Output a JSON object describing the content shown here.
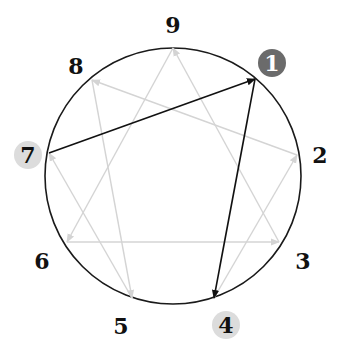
{
  "diagram": {
    "type": "enneagram",
    "circle": {
      "cx": 173,
      "cy": 176,
      "r": 128,
      "stroke": "#1a1a1a"
    },
    "colors": {
      "active_line": "#111111",
      "inactive_line": "#d4d4d4",
      "highlight_dark": "#6b6b6b",
      "highlight_light": "#dcdcdc"
    },
    "points": [
      {
        "id": "1",
        "label": "1",
        "x": 255,
        "y": 79,
        "lx": 272,
        "ly": 63,
        "badge": "dark"
      },
      {
        "id": "2",
        "label": "2",
        "x": 297,
        "y": 155,
        "lx": 320,
        "ly": 155,
        "badge": "none"
      },
      {
        "id": "3",
        "label": "3",
        "x": 279,
        "y": 242,
        "lx": 303,
        "ly": 261,
        "badge": "none"
      },
      {
        "id": "4",
        "label": "4",
        "x": 214,
        "y": 298,
        "lx": 226,
        "ly": 325,
        "badge": "light"
      },
      {
        "id": "5",
        "label": "5",
        "x": 132,
        "y": 298,
        "lx": 121,
        "ly": 326,
        "badge": "none"
      },
      {
        "id": "6",
        "label": "6",
        "x": 67,
        "y": 242,
        "lx": 42,
        "ly": 261,
        "badge": "none"
      },
      {
        "id": "7",
        "label": "7",
        "x": 49,
        "y": 153,
        "lx": 28,
        "ly": 155,
        "badge": "light"
      },
      {
        "id": "8",
        "label": "8",
        "x": 92,
        "y": 80,
        "lx": 76,
        "ly": 66,
        "badge": "none"
      },
      {
        "id": "9",
        "label": "9",
        "x": 173,
        "y": 48,
        "lx": 173,
        "ly": 25,
        "badge": "none"
      }
    ],
    "arrows": [
      {
        "from": "7",
        "to": "1",
        "style": "active"
      },
      {
        "from": "1",
        "to": "4",
        "style": "active"
      },
      {
        "from": "4",
        "to": "2",
        "style": "inactive"
      },
      {
        "from": "2",
        "to": "8",
        "style": "inactive"
      },
      {
        "from": "8",
        "to": "5",
        "style": "inactive"
      },
      {
        "from": "5",
        "to": "7",
        "style": "inactive"
      },
      {
        "from": "9",
        "to": "6",
        "style": "inactive"
      },
      {
        "from": "6",
        "to": "3",
        "style": "inactive"
      },
      {
        "from": "3",
        "to": "9",
        "style": "inactive"
      }
    ]
  }
}
